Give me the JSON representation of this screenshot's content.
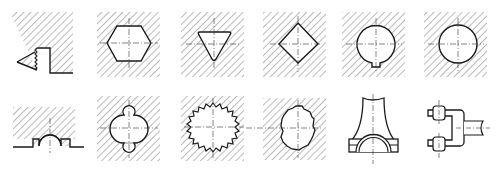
{
  "figure": {
    "stroke_color": "#1a1a1a",
    "hatch_color": "#555555",
    "centerline_color": "#333333",
    "caption": ""
  },
  "panels": [
    {
      "row": 1,
      "col": 1,
      "label": "sawtooth-groove-profile"
    },
    {
      "row": 1,
      "col": 2,
      "label": "hexagon-hole"
    },
    {
      "row": 1,
      "col": 3,
      "label": "triangle-hole"
    },
    {
      "row": 1,
      "col": 4,
      "label": "square-diamond-hole"
    },
    {
      "row": 1,
      "col": 5,
      "label": "round-hole-with-keyway"
    },
    {
      "row": 1,
      "col": 6,
      "label": "round-hole"
    },
    {
      "row": 2,
      "col": 1,
      "label": "semicircular-groove-surface"
    },
    {
      "row": 2,
      "col": 2,
      "label": "multi-radius-shaped-hole"
    },
    {
      "row": 2,
      "col": 3,
      "label": "internal-serration-spline-hole"
    },
    {
      "row": 2,
      "col": 4,
      "label": "involute-spline-hole"
    },
    {
      "row": 2,
      "col": 5,
      "label": "connecting-rod-bearing-seat"
    },
    {
      "row": 2,
      "col": 6,
      "label": "fork-clevis-part"
    }
  ]
}
